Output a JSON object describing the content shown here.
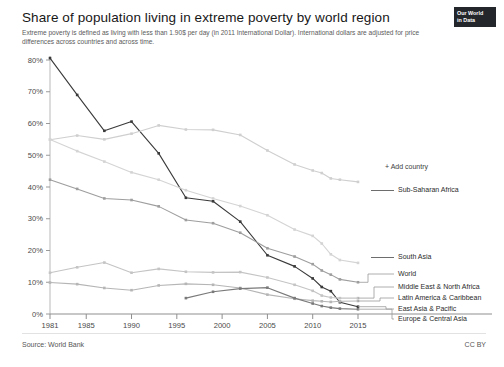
{
  "header": {
    "title": "Share of population living in extreme poverty by world region",
    "subtitle": "Extreme poverty is defined as living with less than 1.90$ per day (in 2011 International Dollar). International dollars are adjusted for price differences across countries and across time.",
    "logo_line1": "Our World",
    "logo_line2": "in Data",
    "logo_icon": "owid-logo-icon"
  },
  "controls": {
    "add_country_label": "+ Add country"
  },
  "footer": {
    "source": "Source: World Bank",
    "license": "CC BY"
  },
  "axes": {
    "y_ticks": [
      "0%",
      "10%",
      "20%",
      "30%",
      "40%",
      "50%",
      "60%",
      "70%",
      "80%"
    ],
    "x_ticks": [
      "1981",
      "1985",
      "1990",
      "1995",
      "2000",
      "2005",
      "2010",
      "2015"
    ]
  },
  "legend": [
    {
      "label": "Sub-Saharan Africa",
      "color": "#cfcfcf",
      "value_2015": 41.6
    },
    {
      "label": "South Asia",
      "color": "#d4d4d4",
      "value_2015": 16.1
    },
    {
      "label": "World",
      "color": "#9e9e9e",
      "value_2015": 10.0
    },
    {
      "label": "Middle East & North Africa",
      "color": "#c4c4c4",
      "value_2015": 5.0
    },
    {
      "label": "Latin America & Caribbean",
      "color": "#b5b5b5",
      "value_2015": 4.1
    },
    {
      "label": "East Asia & Pacific",
      "color": "#3a3a3a",
      "value_2015": 2.3
    },
    {
      "label": "Europe & Central Asia",
      "color": "#7a7a7a",
      "value_2015": 1.5
    }
  ],
  "chart_data": {
    "type": "line",
    "title": "Share of population living in extreme poverty by world region",
    "subtitle": "Extreme poverty is defined as living with less than 1.90$ per day (in 2011 International Dollar). International dollars are adjusted for price differences across countries and across time.",
    "xlabel": "",
    "ylabel": "Share of population (%)",
    "xlim": [
      1981,
      2015
    ],
    "ylim": [
      0,
      80
    ],
    "y_tick_values": [
      0,
      10,
      20,
      30,
      40,
      50,
      60,
      70,
      80
    ],
    "x_tick_values": [
      1981,
      1985,
      1990,
      1995,
      2000,
      2005,
      2010,
      2015
    ],
    "grid": false,
    "legend_position": "right-inline",
    "markers": true,
    "source": "Source: World Bank",
    "license": "CC BY",
    "series": [
      {
        "name": "East Asia & Pacific",
        "color": "#3a3a3a",
        "x": [
          1981,
          1984,
          1987,
          1990,
          1993,
          1996,
          1999,
          2002,
          2005,
          2008,
          2010,
          2011,
          2012,
          2013,
          2015
        ],
        "values": [
          80.6,
          69.0,
          57.7,
          60.6,
          50.6,
          36.6,
          35.5,
          29.1,
          18.5,
          15.0,
          11.2,
          8.5,
          7.2,
          3.7,
          2.3
        ]
      },
      {
        "name": "Sub-Saharan Africa",
        "color": "#cfcfcf",
        "x": [
          1981,
          1984,
          1987,
          1990,
          1993,
          1996,
          1999,
          2002,
          2005,
          2008,
          2010,
          2011,
          2012,
          2013,
          2015
        ],
        "values": [
          54.9,
          56.2,
          55.0,
          56.8,
          59.4,
          58.1,
          58.0,
          56.4,
          51.5,
          47.1,
          45.2,
          44.4,
          42.7,
          42.3,
          41.6
        ]
      },
      {
        "name": "South Asia",
        "color": "#d4d4d4",
        "x": [
          1981,
          1984,
          1987,
          1990,
          1993,
          1996,
          1999,
          2002,
          2005,
          2008,
          2010,
          2011,
          2012,
          2013,
          2015
        ],
        "values": [
          55.0,
          51.3,
          48.0,
          44.6,
          42.3,
          39.0,
          36.4,
          34.0,
          31.1,
          26.6,
          24.6,
          22.2,
          18.8,
          17.0,
          16.1
        ]
      },
      {
        "name": "World",
        "color": "#9e9e9e",
        "x": [
          1981,
          1984,
          1987,
          1990,
          1993,
          1996,
          1999,
          2002,
          2005,
          2008,
          2010,
          2011,
          2012,
          2013,
          2015
        ],
        "values": [
          42.3,
          39.4,
          36.4,
          35.9,
          33.9,
          29.6,
          28.6,
          25.6,
          20.7,
          18.1,
          15.7,
          13.7,
          12.4,
          10.9,
          10.0
        ]
      },
      {
        "name": "Middle East & North Africa",
        "color": "#c4c4c4",
        "x": [
          1981,
          1984,
          1987,
          1990,
          1993,
          1996,
          1999,
          2002,
          2005,
          2008,
          2010,
          2011,
          2012,
          2013,
          2015
        ],
        "values": [
          13.0,
          14.7,
          16.2,
          13.0,
          14.2,
          13.3,
          13.1,
          13.2,
          11.5,
          9.2,
          7.3,
          5.8,
          5.2,
          5.0,
          5.0
        ]
      },
      {
        "name": "Latin America & Caribbean",
        "color": "#b5b5b5",
        "x": [
          1981,
          1984,
          1987,
          1990,
          1993,
          1996,
          1999,
          2002,
          2005,
          2008,
          2010,
          2011,
          2012,
          2013,
          2015
        ],
        "values": [
          9.9,
          9.4,
          8.2,
          7.5,
          9.0,
          9.5,
          9.2,
          8.2,
          6.1,
          4.8,
          4.2,
          4.0,
          3.8,
          4.0,
          4.1
        ]
      },
      {
        "name": "Europe & Central Asia",
        "color": "#7a7a7a",
        "x": [
          1996,
          1999,
          2002,
          2005,
          2008,
          2010,
          2011,
          2012,
          2013,
          2015
        ],
        "values": [
          5.0,
          7.0,
          8.0,
          8.3,
          5.0,
          3.3,
          2.5,
          2.0,
          1.7,
          1.5
        ]
      }
    ]
  }
}
